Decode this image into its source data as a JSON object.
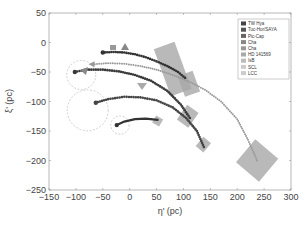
{
  "chart_data": {
    "type": "scatter",
    "title": "",
    "xlabel": "η' (pc)",
    "ylabel": "ξ' (pc)",
    "xlim": [
      -150,
      300
    ],
    "ylim": [
      -250,
      50
    ],
    "xticks": [
      -150,
      -100,
      -50,
      0,
      50,
      100,
      150,
      200,
      250,
      300
    ],
    "yticks": [
      50,
      0,
      -50,
      -100,
      -150,
      -200,
      -250
    ],
    "grid": false,
    "legend_position": "upper right",
    "legend": [
      "TW Hya",
      "Tuc-Hor/SAYA",
      "Pic-Cap",
      "Cha",
      "Cha",
      "HD 141569",
      "IsB",
      "SCL",
      "LCC"
    ],
    "series": [
      {
        "name": "TW Hya",
        "style": "dark dots",
        "color": "#333333",
        "x": [
          -50,
          -30,
          -10,
          10,
          30,
          50,
          70,
          90,
          103
        ],
        "y": [
          -17,
          -16,
          -17,
          -20,
          -25,
          -32,
          -40,
          -50,
          -60
        ]
      },
      {
        "name": "LCC",
        "style": "light dotted",
        "color": "#9a9a9a",
        "x": [
          -69,
          -40,
          -10,
          20,
          50,
          80,
          110,
          140,
          170,
          200,
          220,
          237
        ],
        "y": [
          -37,
          -35,
          -36,
          -40,
          -46,
          -55,
          -66,
          -80,
          -100,
          -130,
          -165,
          -200
        ]
      },
      {
        "name": "Tuc-Hor/SAYA",
        "style": "dark dots",
        "color": "#3a3a3a",
        "x": [
          -102,
          -80,
          -50,
          -20,
          10,
          40,
          70,
          95,
          112
        ],
        "y": [
          -50,
          -46,
          -46,
          -49,
          -55,
          -65,
          -82,
          -105,
          -128
        ]
      },
      {
        "name": "Pic-Cap",
        "style": "dark dots",
        "color": "#444444",
        "x": [
          -63,
          -40,
          -10,
          20,
          50,
          80,
          105,
          125,
          138
        ],
        "y": [
          -102,
          -96,
          -92,
          -93,
          -98,
          -110,
          -128,
          -150,
          -177
        ]
      },
      {
        "name": "Cha",
        "style": "dark line",
        "color": "#333333",
        "x": [
          -24,
          -10,
          10,
          30,
          52
        ],
        "y": [
          -140,
          -134,
          -130,
          -129,
          -131
        ]
      }
    ],
    "annotations": {
      "dashed_circles": [
        {
          "cx": -90,
          "cy": -55,
          "r": 27
        },
        {
          "cx": -78,
          "cy": -115,
          "r": 38
        },
        {
          "cx": -18,
          "cy": -140,
          "r": 17
        }
      ],
      "gray_boxes": [
        {
          "cx": 80,
          "cy": -45,
          "label": "large uncertainty box"
        },
        {
          "cx": 110,
          "cy": -70
        },
        {
          "cx": 108,
          "cy": -125
        },
        {
          "cx": 137,
          "cy": -173
        },
        {
          "cx": 52,
          "cy": -133
        },
        {
          "cx": 237,
          "cy": -200
        }
      ]
    }
  }
}
